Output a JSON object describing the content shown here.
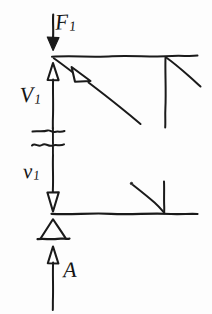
{
  "diagram": {
    "style": {
      "ink_color": "#1a1a1a",
      "background_color": "#fdfdfd",
      "fill_color": "#ffffff"
    },
    "labels": {
      "force_top": {
        "symbol": "F",
        "subscript": "1",
        "text": "F"
      },
      "velocity_upper": {
        "symbol": "V",
        "subscript": "1",
        "text": "V"
      },
      "velocity_lower": {
        "symbol": "v",
        "subscript": "1",
        "text": "v"
      },
      "area_bottom": {
        "symbol": "A",
        "subscript": "",
        "text": "A"
      }
    },
    "elements": {
      "top_force_arrow": "downward filled arrow applying force F1",
      "upper_horizontal_wall": "horizontal boundary line at top",
      "lower_horizontal_wall": "horizontal boundary line at bottom",
      "upper_velocity_arrow": "upward hollow-head arrow labelled V1",
      "lower_velocity_arrow": "downward hollow-head arrow labelled v1",
      "diagonal_flow_arrow": "diagonal hollow-head arrow from upper junction going down-right",
      "break_symbol": "double wavy break indicating omitted length",
      "support_triangle": "hollow triangle support resting on base line",
      "bottom_area_arrow": "upward hollow-head arrow labelled A",
      "upper_right_hatch": "vertical drop line with angled hatch at right of upper wall",
      "lower_right_hatch": "vertical drop line with angled hatch at right of lower wall"
    }
  }
}
